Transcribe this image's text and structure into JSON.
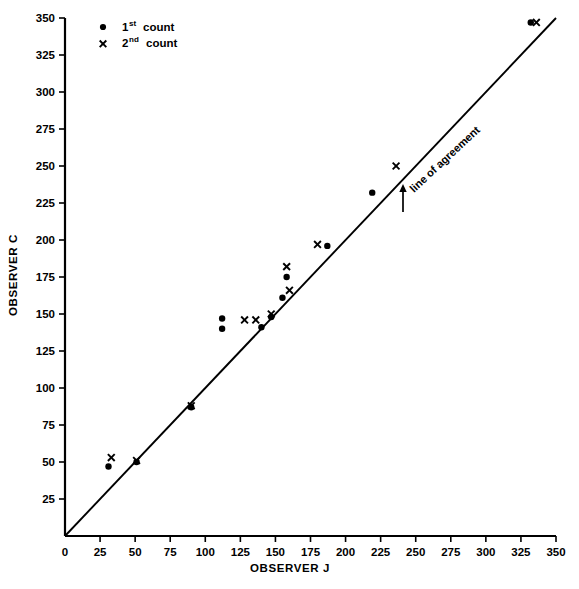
{
  "figure": {
    "background": "#ffffff",
    "ink_color": "#000000"
  },
  "axes": {
    "x": {
      "label": "OBSERVER J",
      "min": 0,
      "max": 350,
      "tick_step": 25,
      "ticks": [
        0,
        25,
        50,
        75,
        100,
        125,
        150,
        175,
        200,
        225,
        250,
        275,
        300,
        325,
        350
      ],
      "tick_labels": [
        "0",
        "25",
        "50",
        "75",
        "100",
        "125",
        "150",
        "175",
        "200",
        "225",
        "250",
        "275",
        "300",
        "325",
        "350"
      ]
    },
    "y": {
      "label": "OBSERVER C",
      "min": 0,
      "max": 350,
      "tick_step": 25,
      "ticks": [
        0,
        25,
        50,
        75,
        100,
        125,
        150,
        175,
        200,
        225,
        250,
        275,
        300,
        325,
        350
      ],
      "tick_labels": [
        "0",
        "25",
        "50",
        "75",
        "100",
        "125",
        "150",
        "175",
        "200",
        "225",
        "250",
        "275",
        "300",
        "325",
        "350"
      ],
      "labeled_ticks": [
        "25",
        "50",
        "75",
        "100",
        "125",
        "150",
        "175",
        "200",
        "225",
        "250",
        "275",
        "300",
        "325",
        "350"
      ]
    }
  },
  "legend": {
    "position": "top-left-inside",
    "entries": [
      {
        "marker": "dot",
        "text_main": "1",
        "text_sup": "st",
        "text_tail": "count",
        "label": "1st count"
      },
      {
        "marker": "x",
        "text_main": "2",
        "text_sup": "nd",
        "text_tail": "count",
        "label": "2nd count"
      }
    ]
  },
  "annotations": [
    {
      "name": "line-of-agreement-label",
      "text": "line of agreement",
      "rotation_deg": -43,
      "has_arrow": true,
      "arrow_direction": "up-left-toward-line"
    }
  ],
  "chart_data": {
    "type": "scatter",
    "title": "",
    "xlabel": "OBSERVER J",
    "ylabel": "OBSERVER C",
    "xlim": [
      0,
      350
    ],
    "ylim": [
      0,
      350
    ],
    "grid": false,
    "legend_position": "upper left",
    "reference_line": {
      "name": "line of agreement",
      "type": "identity",
      "equation": "y = x",
      "from": [
        0,
        0
      ],
      "to": [
        350,
        350
      ]
    },
    "series": [
      {
        "name": "1st count",
        "marker": "dot",
        "points": [
          [
            31,
            47
          ],
          [
            51,
            50
          ],
          [
            90,
            87
          ],
          [
            112,
            147
          ],
          [
            112,
            140
          ],
          [
            140,
            141
          ],
          [
            147,
            148
          ],
          [
            158,
            175
          ],
          [
            155,
            161
          ],
          [
            187,
            196
          ],
          [
            219,
            232
          ],
          [
            332,
            347
          ]
        ]
      },
      {
        "name": "2nd count",
        "marker": "x",
        "points": [
          [
            33,
            53
          ],
          [
            51,
            51
          ],
          [
            90,
            88
          ],
          [
            128,
            146
          ],
          [
            136,
            146
          ],
          [
            147,
            150
          ],
          [
            160,
            166
          ],
          [
            158,
            182
          ],
          [
            180,
            197
          ],
          [
            236,
            250
          ],
          [
            336,
            347
          ]
        ]
      }
    ]
  }
}
